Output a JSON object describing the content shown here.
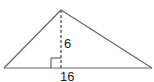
{
  "diagram": {
    "type": "triangle-with-altitude",
    "labels": {
      "height": "6",
      "base": "16"
    },
    "colors": {
      "stroke": "#555555",
      "text": "#222222",
      "background": "#ffffff"
    },
    "geometry": {
      "base_left": [
        4,
        68
      ],
      "base_right": [
        152,
        68
      ],
      "apex": [
        61,
        10
      ],
      "altitude_foot": [
        61,
        68
      ],
      "right_angle_box": {
        "x": 51,
        "y": 58,
        "size": 10
      }
    }
  }
}
